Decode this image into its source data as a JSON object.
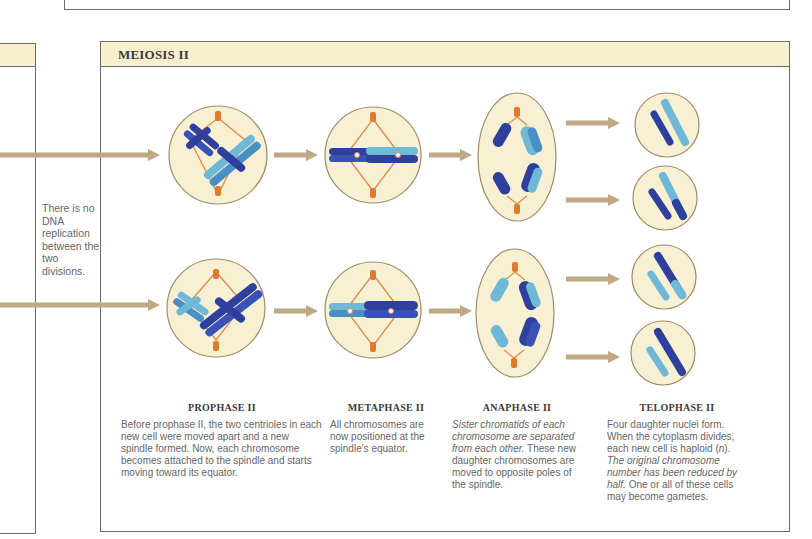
{
  "section": {
    "title": "MEIOSIS II"
  },
  "side_note": "There is no DNA replication between the two divisions.",
  "phases": [
    {
      "name": "PROPHASE II",
      "description": "Before prophase II, the two centrioles in each new cell were moved apart and a new spindle formed. Now, each chromosome becomes attached to the spindle and starts moving toward its equator."
    },
    {
      "name": "METAPHASE II",
      "description": "All chromosomes are now positioned at the spindle's equator."
    },
    {
      "name": "ANAPHASE II",
      "description_italic": "Sister chromatids of each chromosome are separated from each other.",
      "description": " These new daughter chromosomes are moved to opposite poles of the spindle."
    },
    {
      "name": "TELOPHASE II",
      "description_1": "Four daughter nuclei form. When the cytoplasm divides, each new cell is haploid (",
      "description_n": "n",
      "description_2": "). ",
      "description_italic": "The original chromosome number has been reduced by half.",
      "description_3": " One or all of these cells may become gametes."
    }
  ],
  "colors": {
    "header_bg": "#f8efcf",
    "cell_fill": "#f7f0d2",
    "cell_stroke": "#a08a6a",
    "arrow": "#bfa883",
    "spindle": "#e08a4a",
    "centriole": "#e07a30",
    "chrom_dark": "#2e3f9e",
    "chrom_light": "#6fb8d8"
  }
}
